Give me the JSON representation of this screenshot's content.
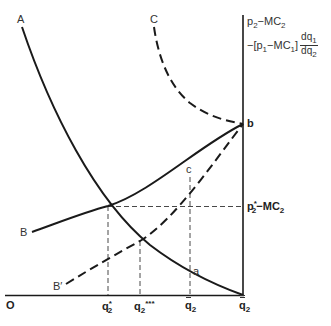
{
  "figure": {
    "type": "economics-diagram",
    "axes": {
      "origin_label": "O",
      "y_axis_label_line1": "p2−MC2",
      "y_axis_label_line1_parts": {
        "p": "p",
        "p_sub": "2",
        "dash": "−MC",
        "mc_sub": "2"
      },
      "y_axis_label_line2_parts": {
        "prefix": "−[p",
        "p_sub": "1",
        "mid": "−MC",
        "mc_sub": "1",
        "close": "]",
        "frac_num": "dq",
        "frac_num_sub": "1",
        "frac_den": "dq",
        "frac_den_sub": "2"
      },
      "x_ticks": [
        {
          "id": "q2_star",
          "base": "q",
          "sub": "2",
          "sup": "*"
        },
        {
          "id": "q2_triple_star",
          "base": "q",
          "sub": "2",
          "sup": "***"
        },
        {
          "id": "q2_tilde",
          "base": "q",
          "sub": "2",
          "mark": "tilde"
        },
        {
          "id": "q2_bar",
          "base": "q",
          "sub": "2",
          "mark": "double-bar"
        }
      ],
      "y_ticks": [
        {
          "id": "p2_star_minus_mc2",
          "parts": {
            "p": "p",
            "sub": "2",
            "sup": "*",
            "rest": "−MC",
            "rest_sub": "2"
          }
        }
      ]
    },
    "curves": [
      {
        "label": "A",
        "style": "solid",
        "description": "downward-sloping convex curve from top-left to q̄2 on horizontal axis"
      },
      {
        "label": "B",
        "style": "solid",
        "description": "upward-sloping concave curve rising to point b on vertical axis"
      },
      {
        "label": "B′",
        "style": "dashed",
        "description": "upward-sloping dashed line rising to point b"
      },
      {
        "label": "C",
        "style": "dashed",
        "description": "dashed curve descending from top to point b"
      }
    ],
    "points": [
      {
        "label": "a"
      },
      {
        "label": "b"
      },
      {
        "label": "c"
      }
    ],
    "curve_labels": {
      "A": "A",
      "B": "B",
      "B_prime": "B′",
      "C": "C"
    },
    "point_labels": {
      "a": "a",
      "b": "b",
      "c": "c"
    },
    "colors": {
      "line": "#1a1a1a",
      "label": "#333333",
      "background": "#ffffff"
    }
  }
}
